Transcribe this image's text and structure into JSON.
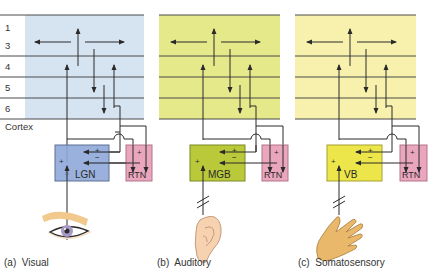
{
  "layers": [
    "1",
    "3",
    "4",
    "5",
    "6"
  ],
  "cortex_label": "Cortex",
  "colors": {
    "visual_cortex_bg": "#d6e3f1",
    "auditory_cortex_bg": "#e6e98a",
    "somato_cortex_bg": "#f7f1ad",
    "lgn_box": "#8ea8d8",
    "mgb_box": "#b9c93a",
    "vb_box": "#ece64a",
    "rtn_box": "#eaa6bd",
    "line": "#2a2a2a"
  },
  "panels": [
    {
      "id": "a",
      "caption": "(a)  Visual",
      "nucleus": "LGN",
      "reticular": "RTN",
      "sense_icon": "eye-icon"
    },
    {
      "id": "b",
      "caption": "(b)  Auditory",
      "nucleus": "MGB",
      "reticular": "RTN",
      "sense_icon": "ear-icon"
    },
    {
      "id": "c",
      "caption": "(c)  Somatosensory",
      "nucleus": "VB",
      "reticular": "RTN",
      "sense_icon": "hand-icon"
    }
  ],
  "signs": {
    "plus": "+",
    "minus": "−"
  }
}
